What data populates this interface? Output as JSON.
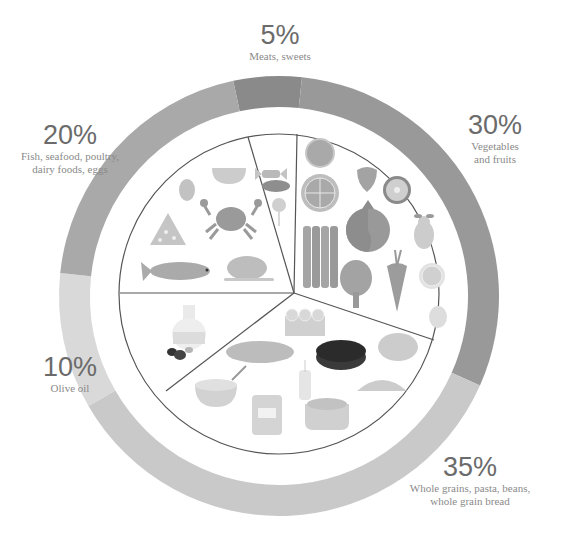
{
  "diagram": {
    "type": "food-plate-pie",
    "colors": {
      "ring_meats": "#8a8a8a",
      "ring_vegetables": "#999999",
      "ring_grains": "#c9c9c9",
      "ring_olive": "#d9d9d9",
      "ring_fish": "#a9a9a9",
      "plate_line": "#555555",
      "plate_fill": "#ffffff"
    }
  },
  "chart_data": {
    "type": "pie",
    "title": "",
    "categories": [
      "Meats, sweets",
      "Vegetables and fruits",
      "Whole grains, pasta, beans, whole grain bread",
      "Olive oil",
      "Fish, seafood, poultry, dairy foods, eggs"
    ],
    "values": [
      5,
      30,
      35,
      10,
      20
    ],
    "unit": "%"
  },
  "segments": [
    {
      "key": "meats",
      "percent_label": "5%",
      "desc_lines": [
        "Meats, sweets"
      ],
      "icons": [
        "candy-icon",
        "sausage-icon",
        "lollipop-icon"
      ]
    },
    {
      "key": "vegetables",
      "percent_label": "30%",
      "desc_lines": [
        "Vegetables",
        "and fruits"
      ],
      "icons": [
        "orange-slice-icon",
        "strawberry-icon",
        "lemon-slice-icon",
        "kiwi-icon",
        "pomegranate-icon",
        "pear-icon",
        "asparagus-icon",
        "artichoke-icon",
        "carrot-icon",
        "citrus-slice-icon",
        "cauliflower-icon"
      ]
    },
    {
      "key": "grains",
      "percent_label": "35%",
      "desc_lines": [
        "Whole grains, pasta, beans,",
        "whole grain bread"
      ],
      "icons": [
        "rolls-basket-icon",
        "baguette-icon",
        "dark-bread-icon",
        "round-bread-icon",
        "rice-bowl-icon",
        "wheat-icon",
        "jar-icon",
        "beans-bowl-icon",
        "croissant-icon"
      ]
    },
    {
      "key": "olive",
      "percent_label": "10%",
      "desc_lines": [
        "Olive oil"
      ],
      "icons": [
        "olive-oil-bottle-icon",
        "olives-icon"
      ]
    },
    {
      "key": "fish",
      "percent_label": "20%",
      "desc_lines": [
        "Fish, seafood, poultry,",
        "dairy foods, eggs"
      ],
      "icons": [
        "egg-icon",
        "bowl-icon",
        "crab-icon",
        "cheese-icon",
        "fish-icon",
        "roast-chicken-icon"
      ]
    }
  ]
}
